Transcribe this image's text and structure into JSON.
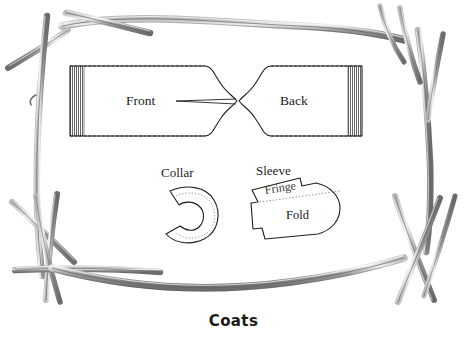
{
  "figure": {
    "caption": "Coats",
    "background_color": "#ffffff",
    "ink_color": "#1a1a1a",
    "twig_color": "#8d8d8d",
    "twig_shade_color": "#5e5e5e",
    "labels": {
      "front": "Front",
      "back": "Back",
      "collar": "Collar",
      "sleeve": "Sleeve",
      "fringe": "Fringe",
      "fold": "Fold"
    },
    "pattern_pieces": [
      {
        "name": "front-panel",
        "label": "Front",
        "fringe_edge": "left",
        "description": "Rectangular body panel with fringed left edge and notched neckline on right"
      },
      {
        "name": "back-panel",
        "label": "Back",
        "fringe_edge": "right",
        "description": "Rectangular body panel with fringed right edge and notched neckline on left"
      },
      {
        "name": "collar-piece",
        "label": "Collar",
        "fringe_edge": "none",
        "description": "Horseshoe C-shape opening to the left with dotted inner stitch line"
      },
      {
        "name": "sleeve-piece",
        "label": "Sleeve",
        "fringe_edge": "top",
        "description": "Angled panel split by a dotted line into Fringe strip above and Fold area below"
      }
    ],
    "border": {
      "name": "twig-frame",
      "description": "Hand-drawn branch and twig border framing the illustration, with crossed sticks at the lower corners"
    }
  }
}
